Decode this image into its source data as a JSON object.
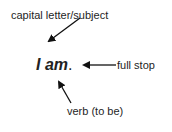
{
  "diagram": {
    "sentence": {
      "words": "I am",
      "punctuation": "."
    },
    "annotations": [
      {
        "id": "subject",
        "label": "capital letter/subject",
        "points_to": "I"
      },
      {
        "id": "full-stop",
        "label": "full stop",
        "points_to": "."
      },
      {
        "id": "verb",
        "label": "verb (to be)",
        "points_to": "am"
      }
    ],
    "colors": {
      "text": "#1e1e1e",
      "arrow": "#111111",
      "background": "#ffffff"
    }
  }
}
